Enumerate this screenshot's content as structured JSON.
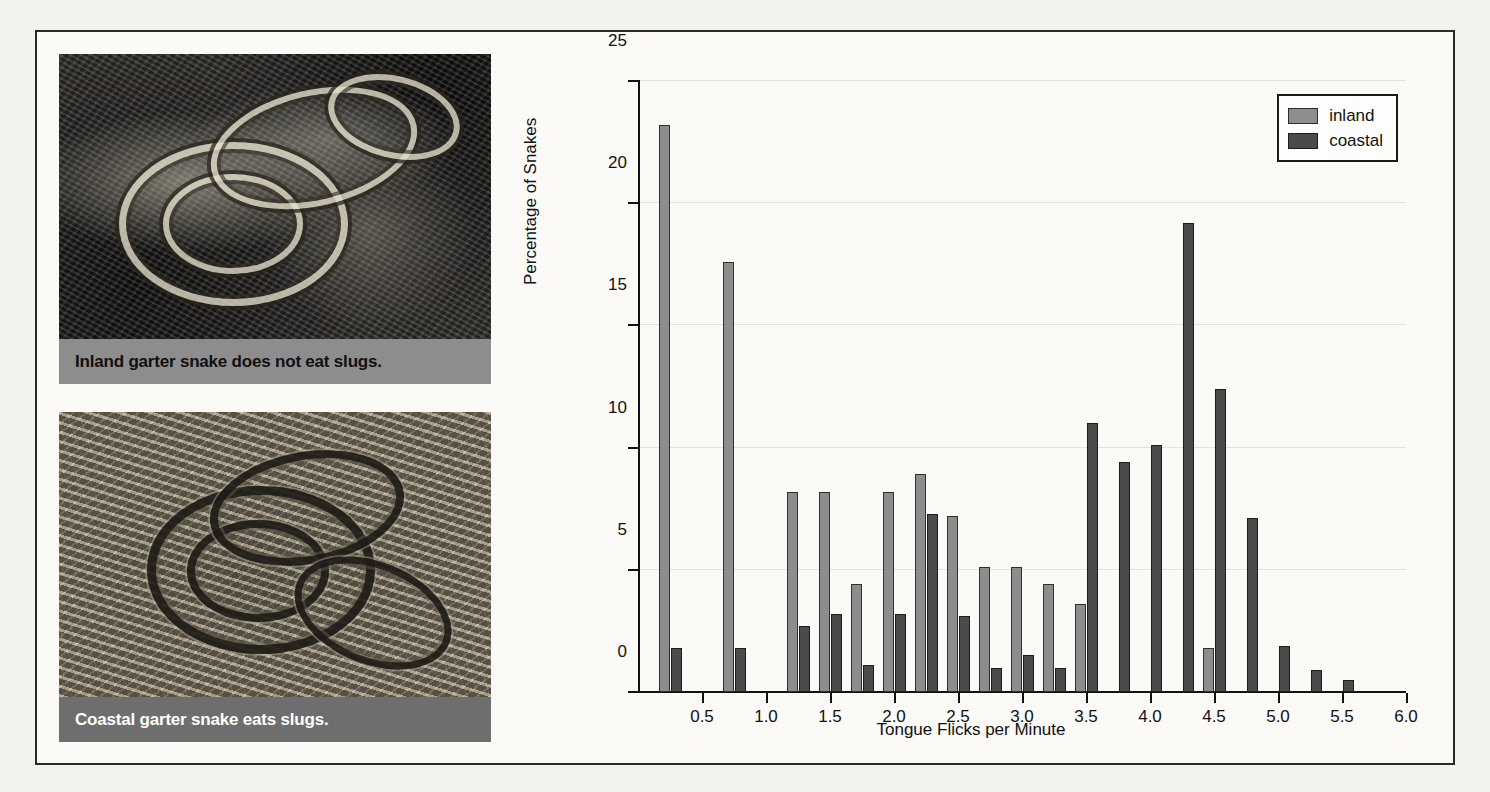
{
  "figure": {
    "photos": [
      {
        "name": "inland-garter-snake",
        "caption": "Inland garter snake does not eat slugs."
      },
      {
        "name": "coastal-garter-snake",
        "caption": "Coastal garter snake eats slugs."
      }
    ]
  },
  "legend": {
    "position": "top-right",
    "entries": [
      {
        "label": "inland",
        "color": "#8d8d8d"
      },
      {
        "label": "coastal",
        "color": "#4b4b4b"
      }
    ]
  },
  "chart_data": {
    "type": "bar",
    "title": "",
    "xlabel": "Tongue Flicks per Minute",
    "ylabel": "Percentage of Snakes",
    "xlim": [
      0,
      6.0
    ],
    "ylim": [
      0,
      25
    ],
    "xticks": [
      0.5,
      1.0,
      1.5,
      2.0,
      2.5,
      3.0,
      3.5,
      4.0,
      4.5,
      5.0,
      5.5,
      6.0
    ],
    "xtick_labels": [
      "0.5",
      "1.0",
      "1.5",
      "2.0",
      "2.5",
      "3.0",
      "3.5",
      "4.0",
      "4.5",
      "5.0",
      "5.5",
      "6.0"
    ],
    "yticks": [
      0,
      5,
      10,
      15,
      20,
      25
    ],
    "ytick_labels": [
      "0",
      "5",
      "10",
      "15",
      "20",
      "25"
    ],
    "grid": "horizontal",
    "bin_width": 0.25,
    "x": [
      0.25,
      0.75,
      1.25,
      1.5,
      1.75,
      2.0,
      2.25,
      2.5,
      2.75,
      3.0,
      3.25,
      3.5,
      3.75,
      4.0,
      4.25,
      4.5,
      4.75,
      5.0,
      5.25,
      5.5
    ],
    "series": [
      {
        "name": "inland",
        "color": "#8d8d8d",
        "values": [
          23.2,
          17.6,
          8.2,
          8.2,
          4.4,
          8.2,
          8.9,
          7.2,
          5.1,
          5.1,
          4.4,
          3.6,
          0,
          0,
          0,
          1.8,
          0,
          0,
          0,
          0
        ]
      },
      {
        "name": "coastal",
        "color": "#4b4b4b",
        "values": [
          1.8,
          1.8,
          2.7,
          3.2,
          1.1,
          3.2,
          7.3,
          3.1,
          1.0,
          1.5,
          1.0,
          11.0,
          9.4,
          10.1,
          19.2,
          12.4,
          7.1,
          1.9,
          0.9,
          0.5
        ]
      }
    ]
  }
}
